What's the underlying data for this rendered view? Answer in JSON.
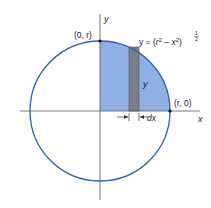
{
  "diagram": {
    "axis_labels": {
      "x": "x",
      "y": "y"
    },
    "points": {
      "top": "(0, r)",
      "right": "(r, 0)"
    },
    "equation": {
      "lhs": "y = (",
      "r": "r",
      "r_exp": "2",
      "minus": " – ",
      "x": "x",
      "x_exp": "2",
      "close": ")",
      "power_num": "1",
      "power_den": "2"
    },
    "strip_height_label": "y",
    "strip_width_label": "dx",
    "colors": {
      "circle": "#2f5fb8",
      "fill": "#8fb1e6",
      "strip": "#7d7f84",
      "axis": "#444444"
    }
  }
}
